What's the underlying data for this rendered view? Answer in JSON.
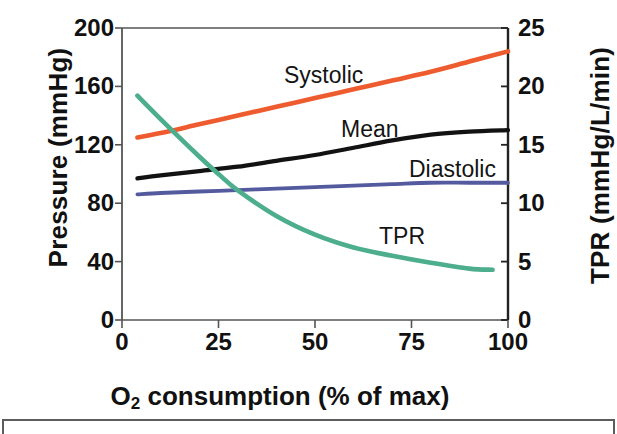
{
  "chart_data": {
    "type": "line",
    "title": "",
    "xlabel": "O₂ consumption (% of max)",
    "ylabel": "Pressure (mmHg)",
    "y2label": "TPR (mmHg/L/min)",
    "xlim": [
      0,
      100
    ],
    "ylim": [
      0,
      200
    ],
    "y2lim": [
      0,
      25
    ],
    "xticks": [
      "0",
      "25",
      "50",
      "75",
      "100"
    ],
    "xtick_values": [
      0,
      25,
      50,
      75,
      100
    ],
    "yticks": [
      "0",
      "40",
      "80",
      "120",
      "160",
      "200"
    ],
    "ytick_values": [
      0,
      40,
      80,
      120,
      160,
      200
    ],
    "y2ticks": [
      "0",
      "5",
      "10",
      "15",
      "20",
      "25"
    ],
    "y2tick_values": [
      0,
      5,
      10,
      15,
      20,
      25
    ],
    "grid": false,
    "legend": "inline-annotations",
    "series": [
      {
        "name": "Systolic",
        "axis": "left",
        "color": "#EE5B2E",
        "x": [
          4,
          10,
          20,
          30,
          40,
          50,
          60,
          70,
          80,
          90,
          100
        ],
        "values": [
          125,
          128,
          134,
          140,
          146,
          152,
          158,
          164,
          170,
          177,
          184
        ]
      },
      {
        "name": "Mean",
        "axis": "left",
        "color": "#121212",
        "x": [
          4,
          10,
          20,
          30,
          40,
          50,
          60,
          70,
          80,
          90,
          100
        ],
        "values": [
          97,
          99,
          102,
          105,
          109,
          113,
          118,
          123,
          127,
          129,
          130
        ]
      },
      {
        "name": "Diastolic",
        "axis": "left",
        "color": "#545A9E",
        "x": [
          4,
          10,
          20,
          30,
          40,
          50,
          60,
          70,
          80,
          90,
          100
        ],
        "values": [
          86,
          87,
          88,
          89,
          90,
          91,
          92,
          93,
          94,
          94,
          94
        ]
      },
      {
        "name": "TPR",
        "axis": "right",
        "color": "#4CAE8D",
        "x": [
          4,
          10,
          20,
          25,
          30,
          40,
          50,
          60,
          70,
          80,
          90,
          96
        ],
        "values": [
          19.2,
          17.2,
          14.0,
          12.5,
          11.1,
          8.9,
          7.3,
          6.2,
          5.5,
          4.9,
          4.4,
          4.3
        ]
      }
    ],
    "annotations": [
      {
        "text": "Systolic",
        "x_px": 284,
        "y_px": 62
      },
      {
        "text": "Mean",
        "x_px": 341,
        "y_px": 116
      },
      {
        "text": "Diastolic",
        "x_px": 409,
        "y_px": 156
      },
      {
        "text": "TPR",
        "x_px": 379,
        "y_px": 223
      }
    ]
  }
}
